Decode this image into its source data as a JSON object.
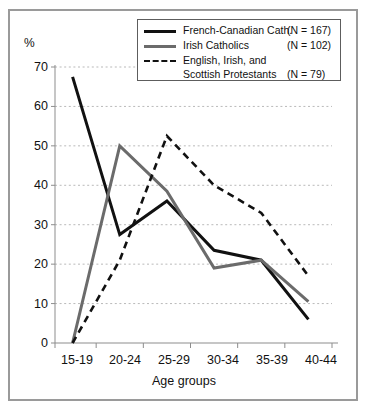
{
  "figure": {
    "background": "#ffffff",
    "border_color": "#9a9a9a"
  },
  "axis": {
    "y_unit_label": "%",
    "y_ticks": [
      "70",
      "60",
      "50",
      "40",
      "30",
      "20",
      "10",
      "0"
    ],
    "x_title": "Age groups",
    "x_ticks": [
      "15-19",
      "20-24",
      "25-29",
      "30-34",
      "35-39",
      "40-44"
    ]
  },
  "legend": {
    "entries": [
      {
        "label": "French-Canadian Cath.",
        "n": "(N = 167)",
        "style": "solid",
        "color": "#111111"
      },
      {
        "label": "Irish Catholics",
        "n": "(N = 102)",
        "style": "solid",
        "color": "#6b6b6b"
      },
      {
        "label": "English, Irish, and",
        "label2": "Scottish Protestants",
        "n": "(N =   79)",
        "style": "dashed",
        "color": "#111111"
      }
    ]
  },
  "chart_data": {
    "type": "line",
    "title": "",
    "xlabel": "Age groups",
    "ylabel": "%",
    "categories": [
      "15-19",
      "20-24",
      "25-29",
      "30-34",
      "35-39",
      "40-44"
    ],
    "ylim": [
      0,
      70
    ],
    "ytick_step": 10,
    "grid": true,
    "legend_position": "top-right",
    "series": [
      {
        "name": "French-Canadian Cath.",
        "n": 167,
        "color": "#111111",
        "style": "solid",
        "values": [
          67.5,
          27.5,
          36.0,
          23.5,
          21.0,
          6.0
        ]
      },
      {
        "name": "Irish Catholics",
        "n": 102,
        "color": "#6b6b6b",
        "style": "solid",
        "values": [
          0,
          50.0,
          38.5,
          19.0,
          21.0,
          10.5
        ]
      },
      {
        "name": "English, Irish, and Scottish Protestants",
        "n": 79,
        "color": "#111111",
        "style": "dashed",
        "values": [
          0,
          21.0,
          52.5,
          40.0,
          33.0,
          17.0
        ]
      }
    ]
  }
}
